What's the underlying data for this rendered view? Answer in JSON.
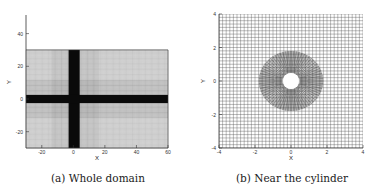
{
  "figure": {
    "panels": [
      {
        "id": "a",
        "caption": "(a)  Whole domain",
        "xlabel": "X",
        "ylabel": "Y",
        "xticks": [
          "-20",
          "0",
          "20",
          "40",
          "60"
        ],
        "yticks": [
          "40",
          "20",
          "0",
          "-20"
        ],
        "xlim": [
          -30,
          60
        ],
        "ylim": [
          -30,
          55
        ],
        "grid_extent": {
          "x": [
            -30,
            60
          ],
          "y": [
            -30,
            30
          ]
        }
      },
      {
        "id": "b",
        "caption": "(b)  Near the cylinder",
        "xlabel": "X",
        "ylabel": "Y",
        "xticks": [
          "-4",
          "-2",
          "0",
          "2",
          "4"
        ],
        "yticks": [
          "4",
          "2",
          "0",
          "-2",
          "-4"
        ],
        "xlim": [
          -4,
          4
        ],
        "ylim": [
          -4,
          4
        ],
        "cylinder_radius": 0.5
      }
    ]
  },
  "chart_data": [
    {
      "type": "mesh",
      "title": "(a) Whole domain",
      "xlabel": "X",
      "ylabel": "Y",
      "xlim": [
        -30,
        60
      ],
      "ylim": [
        -30,
        55
      ],
      "xticks": [
        -20,
        0,
        20,
        40,
        60
      ],
      "yticks": [
        -20,
        0,
        20,
        40
      ],
      "grid": true,
      "description": "Structured computational mesh spanning x in [-30,60], y in [-30,30], refined (dense) bands around x≈0 (vertical) and y≈0 (horizontal)"
    },
    {
      "type": "mesh",
      "title": "(b) Near the cylinder",
      "xlabel": "X",
      "ylabel": "Y",
      "xlim": [
        -4,
        4
      ],
      "ylim": [
        -4,
        4
      ],
      "xticks": [
        -4,
        -2,
        0,
        2,
        4
      ],
      "yticks": [
        -4,
        -2,
        0,
        2,
        4
      ],
      "grid": true,
      "description": "Close-up mesh with O-type refinement around a circular cylinder of radius 0.5 centered at origin, blended into Cartesian grid"
    }
  ]
}
